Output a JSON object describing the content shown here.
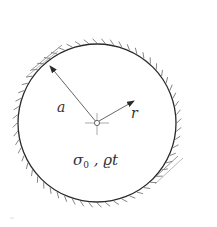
{
  "figure": {
    "colors": {
      "line": "#2a2a2a",
      "thin_line": "#555555",
      "hatch": "#777777",
      "background": "#ffffff"
    },
    "labels": {
      "radius": "a",
      "coordinate": "r",
      "parameters_main": "σ",
      "parameters_sub": "0",
      "parameters_rest": " , ϱt"
    }
  }
}
